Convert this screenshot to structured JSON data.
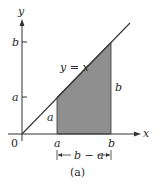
{
  "figure": {
    "caption": "(a)",
    "axes": {
      "x_label": "x",
      "y_label": "y",
      "origin_label": "0"
    },
    "line_label": "y = x",
    "x_ticks": {
      "a": "a",
      "b": "b"
    },
    "y_ticks": {
      "a": "a",
      "b": "b"
    },
    "region": {
      "left_height_label": "a",
      "right_height_label": "b",
      "width_label": "|←b − a→|",
      "width_text": "b − a",
      "fill_color": "#8f8f8f"
    },
    "colors": {
      "axis": "#333333",
      "line": "#3a3a3a",
      "shade": "#8f8f8f"
    }
  }
}
